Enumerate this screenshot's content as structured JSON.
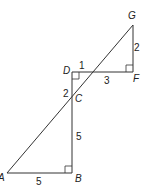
{
  "diagram": {
    "points": {
      "A": {
        "label": "A",
        "x": 7,
        "y": 173
      },
      "B": {
        "label": "B",
        "x": 72,
        "y": 173
      },
      "C": {
        "label": "C",
        "x": 72,
        "y": 98
      },
      "D": {
        "label": "D",
        "x": 72,
        "y": 72
      },
      "F": {
        "label": "F",
        "x": 133,
        "y": 72
      },
      "G": {
        "label": "G",
        "x": 133,
        "y": 25
      }
    },
    "segments": [
      {
        "from": "A",
        "to": "G",
        "label": ""
      },
      {
        "from": "A",
        "to": "B",
        "label": "5"
      },
      {
        "from": "B",
        "to": "C",
        "label": "5"
      },
      {
        "from": "C",
        "to": "D",
        "label": "2"
      },
      {
        "from": "D",
        "to": "F",
        "label": "3"
      },
      {
        "from": "F",
        "to": "G",
        "label": "2"
      }
    ],
    "extra_labels": [
      {
        "text": "1",
        "note": "segment from D to intersection of AG with DF"
      }
    ],
    "right_angles": [
      "B",
      "D",
      "F"
    ]
  }
}
